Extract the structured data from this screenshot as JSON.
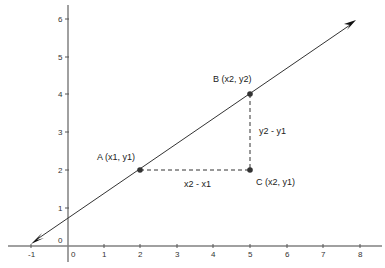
{
  "diagram": {
    "type": "coordinate-plane-slope",
    "x_ticks": [
      "-1",
      "0",
      "1",
      "2",
      "3",
      "4",
      "5",
      "6",
      "7",
      "8"
    ],
    "y_ticks": [
      "0",
      "1",
      "2",
      "3",
      "4",
      "5",
      "6"
    ],
    "points": {
      "A": {
        "label": "A (x1, y1)",
        "x": 2,
        "y": 2
      },
      "B": {
        "label": "B (x2, y2)",
        "x": 5,
        "y": 4
      },
      "C": {
        "label": "C (x2, y1)",
        "x": 5,
        "y": 2
      }
    },
    "run_label": "x2 - x1",
    "rise_label": "y2 - y1",
    "colors": {
      "axis": "#808080",
      "line": "#333333",
      "point": "#333333",
      "dashed": "#333333"
    }
  }
}
